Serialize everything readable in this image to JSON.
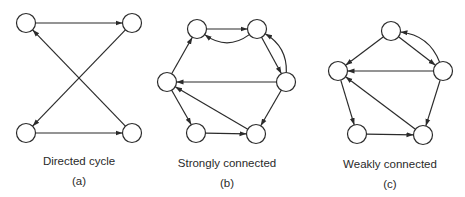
{
  "style": {
    "stroke": "#2b2b2b",
    "node_fill": "#ffffff",
    "node_radius": 9.5
  },
  "panels": [
    {
      "id": "a",
      "caption": "Directed cycle",
      "label": "(a)",
      "caption_pos": [
        79,
        155
      ],
      "label_pos": [
        79,
        175
      ],
      "nodes": {
        "tl": [
          26,
          23
        ],
        "tr": [
          132,
          23
        ],
        "bl": [
          26,
          133
        ],
        "br": [
          132,
          133
        ]
      },
      "edges": [
        {
          "from": "tl",
          "to": "tr"
        },
        {
          "from": "tr",
          "to": "bl"
        },
        {
          "from": "bl",
          "to": "br"
        },
        {
          "from": "br",
          "to": "tl"
        }
      ]
    },
    {
      "id": "b",
      "caption": "Strongly connected",
      "label": "(b)",
      "caption_pos": [
        227,
        157
      ],
      "label_pos": [
        227,
        177
      ],
      "nodes": {
        "tl": [
          197,
          29
        ],
        "tr": [
          257,
          29
        ],
        "l": [
          167,
          82
        ],
        "r": [
          286,
          82
        ],
        "bl": [
          196,
          133
        ],
        "br": [
          256,
          134
        ]
      },
      "edges": [
        {
          "from": "tl",
          "to": "tr"
        },
        {
          "from": "tr",
          "to": "tl",
          "curve": -22
        },
        {
          "from": "tr",
          "to": "r"
        },
        {
          "from": "r",
          "to": "tr",
          "curve": 18
        },
        {
          "from": "r",
          "to": "l"
        },
        {
          "from": "r",
          "to": "br"
        },
        {
          "from": "br",
          "to": "l"
        },
        {
          "from": "l",
          "to": "bl"
        },
        {
          "from": "bl",
          "to": "br"
        },
        {
          "from": "l",
          "to": "tl"
        }
      ]
    },
    {
      "id": "c",
      "caption": "Weakly connected",
      "label": "(c)",
      "caption_pos": [
        390,
        158
      ],
      "label_pos": [
        390,
        178
      ],
      "nodes": {
        "t": [
          391,
          31
        ],
        "l": [
          338,
          71
        ],
        "r": [
          443,
          71
        ],
        "bl": [
          357,
          134
        ],
        "br": [
          423,
          135
        ]
      },
      "edges": [
        {
          "from": "t",
          "to": "l"
        },
        {
          "from": "t",
          "to": "r"
        },
        {
          "from": "r",
          "to": "t",
          "curve": 20
        },
        {
          "from": "r",
          "to": "l"
        },
        {
          "from": "r",
          "to": "br"
        },
        {
          "from": "br",
          "to": "l"
        },
        {
          "from": "l",
          "to": "bl"
        },
        {
          "from": "bl",
          "to": "br"
        }
      ]
    }
  ]
}
